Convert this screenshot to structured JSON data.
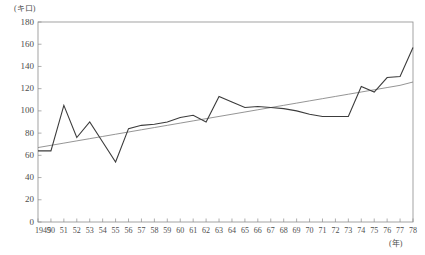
{
  "chart_data": {
    "type": "line",
    "title": "",
    "subtitle": "",
    "xlabel": "(年)",
    "ylabel": "(キロ)",
    "xlim": [
      1949,
      1978
    ],
    "ylim": [
      0,
      180
    ],
    "grid": false,
    "legend": "none",
    "y_ticks": [
      0,
      20,
      40,
      60,
      80,
      100,
      120,
      140,
      160,
      180
    ],
    "y_tick_labels": [
      "0",
      "20",
      "40",
      "60",
      "80",
      "100",
      "120",
      "140",
      "160",
      "180"
    ],
    "x_tick_labels": [
      "1949",
      "50",
      "51",
      "52",
      "53",
      "54",
      "55",
      "56",
      "57",
      "58",
      "59",
      "60",
      "61",
      "62",
      "63",
      "64",
      "65",
      "66",
      "67",
      "68",
      "69",
      "70",
      "71",
      "72",
      "73",
      "74",
      "75",
      "76",
      "77",
      "78"
    ],
    "x": [
      1949,
      1950,
      1951,
      1952,
      1953,
      1954,
      1955,
      1956,
      1957,
      1958,
      1959,
      1960,
      1961,
      1962,
      1963,
      1964,
      1965,
      1966,
      1967,
      1968,
      1969,
      1970,
      1971,
      1972,
      1973,
      1974,
      1975,
      1976,
      1977,
      1978
    ],
    "series": [
      {
        "name": "観測値",
        "kind": "data-line",
        "color": "#3c3c3c",
        "values": [
          64,
          64,
          105,
          76,
          90,
          72,
          54,
          84,
          87,
          88,
          90,
          94,
          96,
          90,
          113,
          108,
          103,
          104,
          103,
          102,
          100,
          97,
          95,
          95,
          95,
          122,
          117,
          130,
          131,
          157
        ]
      },
      {
        "name": "トレンド線",
        "kind": "trend-line",
        "color": "#7a7a7a",
        "values": [
          67,
          69,
          71,
          73,
          75,
          77,
          79,
          81,
          83,
          85,
          87,
          89,
          91,
          93,
          95,
          97,
          99,
          101,
          103,
          105,
          107,
          109,
          111,
          113,
          115,
          117,
          119,
          121,
          123,
          126
        ]
      }
    ],
    "axis_color": "#8c8c8c",
    "plot_bounds": {
      "left": 38,
      "right": 413,
      "top": 22,
      "bottom": 222
    }
  }
}
